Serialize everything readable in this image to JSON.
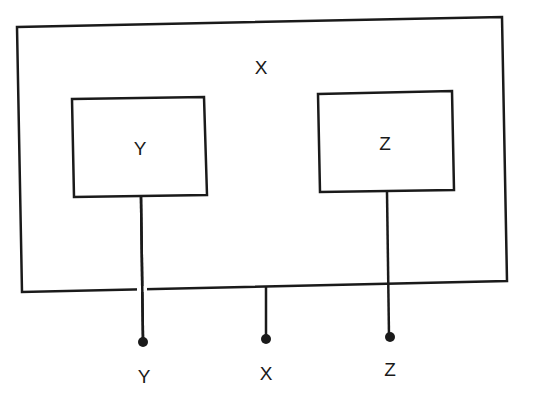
{
  "diagram": {
    "outer_box": {
      "label": "X"
    },
    "inner_boxes": [
      {
        "label": "Y"
      },
      {
        "label": "Z"
      }
    ],
    "terminals": [
      {
        "label": "Y"
      },
      {
        "label": "X"
      },
      {
        "label": "Z"
      }
    ],
    "stroke_color": "#1a1a1a",
    "background_color": "#ffffff"
  }
}
